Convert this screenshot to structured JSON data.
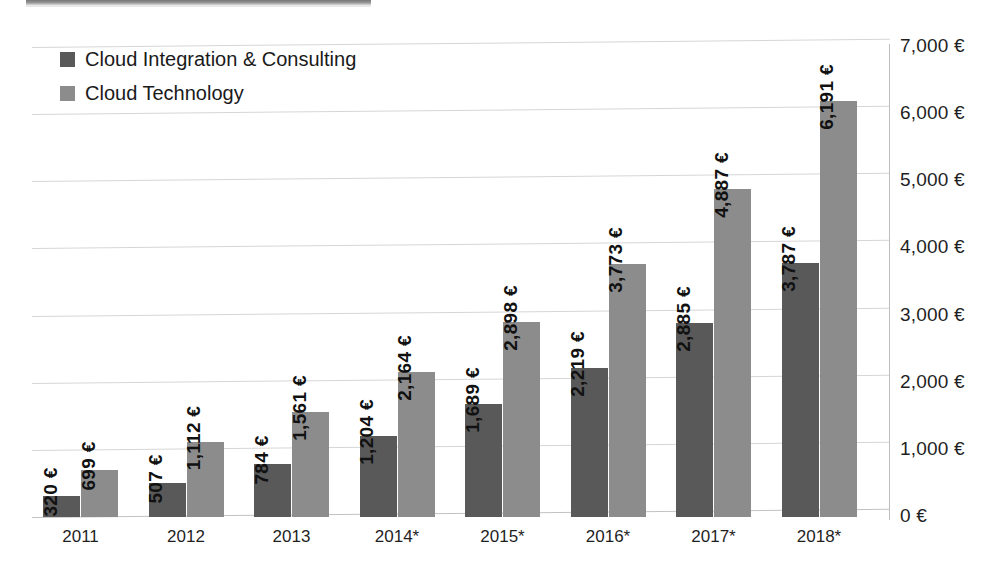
{
  "chart_data": {
    "type": "bar",
    "title": "",
    "subtitle": "",
    "xlabel": "",
    "ylabel": "",
    "categories": [
      "2011",
      "2012",
      "2013",
      "2014*",
      "2015*",
      "2016*",
      "2017*",
      "2018*"
    ],
    "series": [
      {
        "name": "Cloud Integration & Consulting",
        "color": "#595959",
        "values": [
          320,
          507,
          784,
          1204,
          1689,
          2219,
          2885,
          3787
        ],
        "labels": [
          "320 €",
          "507 €",
          "784 €",
          "1,204 €",
          "1,689 €",
          "2,219 €",
          "2,885 €",
          "3,787 €"
        ]
      },
      {
        "name": "Cloud Technology",
        "color": "#8c8c8c",
        "values": [
          699,
          1112,
          1561,
          2164,
          2898,
          3773,
          4887,
          6191
        ],
        "labels": [
          "699 €",
          "1,112 €",
          "1,561 €",
          "2,164 €",
          "2,898 €",
          "3,773 €",
          "4,887 €",
          "6,191 €"
        ]
      }
    ],
    "ylim": [
      0,
      7000
    ],
    "ytick_values": [
      0,
      1000,
      2000,
      3000,
      4000,
      5000,
      6000,
      7000
    ],
    "ytick_labels": [
      "0 €",
      "1,000 €",
      "2,000 €",
      "3,000 €",
      "4,000 €",
      "5,000 €",
      "6,000 €",
      "7,000 €"
    ],
    "grid": true,
    "legend_position": "top-left",
    "value_labels_rotation": 90,
    "units": "EUR millions"
  },
  "legend": {
    "items": [
      {
        "label": "Cloud Integration & Consulting",
        "color": "#595959"
      },
      {
        "label": "Cloud Technology",
        "color": "#8c8c8c"
      }
    ]
  },
  "axis": {
    "y_labels": [
      "7,000 €",
      "6,000 €",
      "5,000 €",
      "4,000 €",
      "3,000 €",
      "2,000 €",
      "1,000 €",
      "0 €"
    ],
    "x_labels": [
      "2011",
      "2012",
      "2013",
      "2014*",
      "2015*",
      "2016*",
      "2017*",
      "2018*"
    ]
  }
}
